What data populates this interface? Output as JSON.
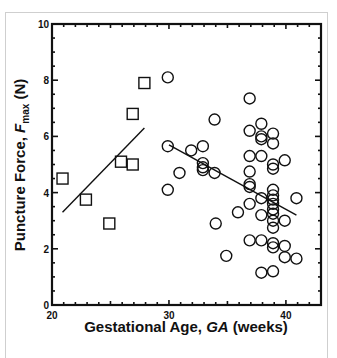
{
  "chart_data": {
    "type": "scatter",
    "title": "",
    "xlabel": "Gestational Age, GA (weeks)",
    "ylabel": "Puncture Force, Fmax (N)",
    "xlabel_parts": {
      "pre": "Gestational Age, ",
      "italic": "GA",
      "post": " (weeks)"
    },
    "ylabel_parts": {
      "pre": "Puncture Force, ",
      "italic": "F",
      "sub": "max",
      "post": " (N)"
    },
    "xlim": [
      20,
      43
    ],
    "ylim": [
      0,
      10
    ],
    "x_ticks": [
      20,
      30,
      40
    ],
    "y_ticks": [
      0,
      2,
      4,
      6,
      8,
      10
    ],
    "grid": false,
    "legend": null,
    "series": [
      {
        "name": "squares",
        "marker": "square",
        "points": [
          [
            20.9,
            4.5
          ],
          [
            22.9,
            3.75
          ],
          [
            24.9,
            2.9
          ],
          [
            25.9,
            5.1
          ],
          [
            26.9,
            5.0
          ],
          [
            26.9,
            6.8
          ],
          [
            27.9,
            7.9
          ]
        ],
        "fit_line": [
          [
            20.9,
            3.3
          ],
          [
            27.9,
            6.3
          ]
        ]
      },
      {
        "name": "circles",
        "marker": "circle",
        "points": [
          [
            29.9,
            8.1
          ],
          [
            29.9,
            5.65
          ],
          [
            29.9,
            4.1
          ],
          [
            30.9,
            4.7
          ],
          [
            31.9,
            5.5
          ],
          [
            32.9,
            5.65
          ],
          [
            32.9,
            5.05
          ],
          [
            32.9,
            4.9
          ],
          [
            32.9,
            4.8
          ],
          [
            33.9,
            6.6
          ],
          [
            33.9,
            4.7
          ],
          [
            34.0,
            2.9
          ],
          [
            34.9,
            1.75
          ],
          [
            35.9,
            3.3
          ],
          [
            36.9,
            7.35
          ],
          [
            36.9,
            6.2
          ],
          [
            36.9,
            5.3
          ],
          [
            36.9,
            4.75
          ],
          [
            36.9,
            4.3
          ],
          [
            36.9,
            4.2
          ],
          [
            36.9,
            3.6
          ],
          [
            36.9,
            2.3
          ],
          [
            37.9,
            6.45
          ],
          [
            37.9,
            6.0
          ],
          [
            37.9,
            5.9
          ],
          [
            37.9,
            5.3
          ],
          [
            37.9,
            3.8
          ],
          [
            37.9,
            3.2
          ],
          [
            37.9,
            2.3
          ],
          [
            37.9,
            1.15
          ],
          [
            38.9,
            6.1
          ],
          [
            38.9,
            5.75
          ],
          [
            38.9,
            5.0
          ],
          [
            38.9,
            4.85
          ],
          [
            38.9,
            4.1
          ],
          [
            38.9,
            3.9
          ],
          [
            38.9,
            3.75
          ],
          [
            38.9,
            3.6
          ],
          [
            38.9,
            3.4
          ],
          [
            38.9,
            3.25
          ],
          [
            38.9,
            3.0
          ],
          [
            38.9,
            2.75
          ],
          [
            38.9,
            2.2
          ],
          [
            38.9,
            2.05
          ],
          [
            38.9,
            1.2
          ],
          [
            39.9,
            5.15
          ],
          [
            39.9,
            3.0
          ],
          [
            39.9,
            2.1
          ],
          [
            39.9,
            1.7
          ],
          [
            40.9,
            3.8
          ],
          [
            40.9,
            1.65
          ]
        ],
        "fit_line": [
          [
            30.0,
            5.7
          ],
          [
            40.9,
            3.2
          ]
        ]
      }
    ]
  }
}
